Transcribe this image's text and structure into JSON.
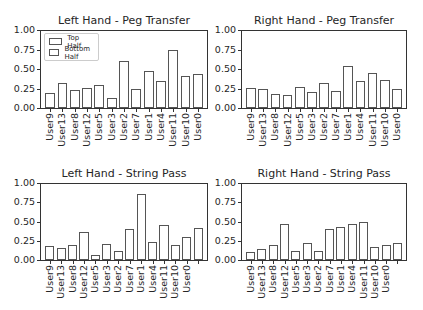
{
  "legend": {
    "items": [
      {
        "label": "Top Half"
      },
      {
        "label": "Bottom Half"
      }
    ]
  },
  "yticks": [
    "1.00",
    "0.75",
    "0.50",
    "0.25",
    "0.00"
  ],
  "chart_data": [
    {
      "type": "bar",
      "title": "Left Hand - Peg Transfer",
      "xlabel": "",
      "ylabel": "",
      "ylim": [
        0,
        1.0
      ],
      "categories": [
        "User9",
        "User13",
        "User8",
        "User12",
        "User5",
        "User3",
        "User2",
        "User7",
        "User1",
        "User4",
        "User11",
        "User10",
        "User0"
      ],
      "values": [
        0.19,
        0.32,
        0.23,
        0.26,
        0.29,
        0.13,
        0.6,
        0.24,
        0.47,
        0.35,
        0.74,
        0.41,
        0.44
      ],
      "legend": [
        "Top Half",
        "Bottom Half"
      ],
      "legend_position": "upper left"
    },
    {
      "type": "bar",
      "title": "Right Hand - Peg Transfer",
      "xlabel": "",
      "ylabel": "",
      "ylim": [
        0,
        1.0
      ],
      "categories": [
        "User9",
        "User13",
        "User8",
        "User12",
        "User5",
        "User3",
        "User2",
        "User7",
        "User1",
        "User4",
        "User11",
        "User10",
        "User0"
      ],
      "values": [
        0.26,
        0.25,
        0.18,
        0.17,
        0.27,
        0.2,
        0.32,
        0.22,
        0.54,
        0.34,
        0.45,
        0.36,
        0.25
      ]
    },
    {
      "type": "bar",
      "title": "Left Hand - String Pass",
      "xlabel": "",
      "ylabel": "",
      "ylim": [
        0,
        1.0
      ],
      "categories": [
        "User9",
        "User13",
        "User8",
        "User12",
        "User5",
        "User3",
        "User2",
        "User7",
        "User1",
        "User4",
        "User11",
        "User10",
        "User0",
        ""
      ],
      "values": [
        0.18,
        0.15,
        0.19,
        0.37,
        0.07,
        0.21,
        0.12,
        0.4,
        0.86,
        0.24,
        0.45,
        0.19,
        0.3,
        0.41
      ]
    },
    {
      "type": "bar",
      "title": "Right Hand - String Pass",
      "xlabel": "",
      "ylabel": "",
      "ylim": [
        0,
        1.0
      ],
      "categories": [
        "User9",
        "User13",
        "User8",
        "User12",
        "User5",
        "User3",
        "User2",
        "User7",
        "User1",
        "User4",
        "User11",
        "User10",
        "User0",
        ""
      ],
      "values": [
        0.1,
        0.14,
        0.2,
        0.47,
        0.12,
        0.22,
        0.12,
        0.4,
        0.43,
        0.47,
        0.49,
        0.17,
        0.2,
        0.22
      ]
    }
  ]
}
